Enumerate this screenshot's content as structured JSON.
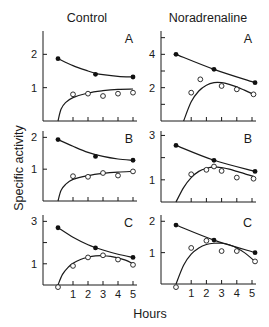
{
  "chart_data": {
    "type": "scatter",
    "title": "",
    "xlabel": "Hours",
    "ylabel": "Specific activity",
    "columns": [
      "Control",
      "Noradrenaline"
    ],
    "rows": [
      "A",
      "B",
      "C"
    ],
    "x_ticks": [
      1,
      2,
      3,
      4,
      5
    ],
    "legend": [
      {
        "marker": "filled-circle",
        "name": "series 1 (filled)"
      },
      {
        "marker": "open-circle",
        "name": "series 2 (open)"
      }
    ],
    "panels": [
      {
        "id": "control-A",
        "column": "Control",
        "row": "A",
        "letter": "A",
        "ylim": [
          0,
          2.7
        ],
        "y_ticks_major": [
          1,
          2
        ],
        "y_ticks_minor": [],
        "filled": {
          "x": [
            0,
            2.5,
            5
          ],
          "y": [
            1.87,
            1.4,
            1.32
          ]
        },
        "open": {
          "x": [
            1,
            2,
            3,
            4,
            5
          ],
          "y": [
            0.8,
            0.82,
            0.75,
            0.82,
            0.85
          ]
        },
        "filled_curve": {
          "x": [
            0,
            1,
            2,
            2.5,
            3,
            4,
            5
          ],
          "y": [
            1.87,
            1.66,
            1.5,
            1.43,
            1.39,
            1.34,
            1.32
          ]
        },
        "open_curve": {
          "x": [
            0,
            0.2,
            0.5,
            1,
            2,
            3,
            4,
            5
          ],
          "y": [
            0.0,
            0.35,
            0.55,
            0.7,
            0.84,
            0.91,
            0.95,
            0.96
          ]
        }
      },
      {
        "id": "noradrenaline-A",
        "column": "Noradrenaline",
        "row": "A",
        "letter": "A",
        "ylim": [
          0,
          5.4
        ],
        "y_ticks_major": [
          2,
          4
        ],
        "y_ticks_minor": [
          1,
          3,
          5
        ],
        "filled": {
          "x": [
            0,
            2.5,
            5.2
          ],
          "y": [
            4.0,
            3.1,
            2.3
          ]
        },
        "open": {
          "x": [
            1,
            1.6,
            3,
            4,
            5.1
          ],
          "y": [
            1.7,
            2.5,
            2.1,
            1.9,
            1.6
          ]
        },
        "filled_curve": {
          "x": [
            0,
            2.5,
            5.2
          ],
          "y": [
            4.0,
            3.1,
            2.3
          ]
        },
        "open_curve": {
          "x": [
            0.5,
            1,
            1.5,
            2,
            2.5,
            3,
            3.5,
            4,
            4.5,
            5.1
          ],
          "y": [
            0.0,
            1.15,
            1.8,
            2.15,
            2.3,
            2.3,
            2.2,
            2.05,
            1.85,
            1.6
          ]
        }
      },
      {
        "id": "control-B",
        "column": "Control",
        "row": "B",
        "letter": "B",
        "ylim": [
          0,
          2.2
        ],
        "y_ticks_major": [
          1,
          2
        ],
        "y_ticks_minor": [],
        "filled": {
          "x": [
            0,
            2.5,
            5
          ],
          "y": [
            1.93,
            1.4,
            1.28
          ]
        },
        "open": {
          "x": [
            1,
            2,
            3,
            4,
            5
          ],
          "y": [
            0.78,
            0.76,
            0.88,
            0.8,
            0.93
          ]
        },
        "filled_curve": {
          "x": [
            0,
            1,
            2,
            3,
            4,
            5
          ],
          "y": [
            1.93,
            1.72,
            1.53,
            1.4,
            1.32,
            1.28
          ]
        },
        "open_curve": {
          "x": [
            0,
            0.2,
            0.5,
            1,
            2,
            3,
            4,
            5
          ],
          "y": [
            0.0,
            0.33,
            0.52,
            0.68,
            0.8,
            0.87,
            0.91,
            0.93
          ]
        }
      },
      {
        "id": "noradrenaline-B",
        "column": "Noradrenaline",
        "row": "B",
        "letter": "B",
        "ylim": [
          0,
          3.2
        ],
        "y_ticks_major": [
          1,
          3
        ],
        "y_ticks_minor": [
          2
        ],
        "filled": {
          "x": [
            0,
            2.5,
            5.2
          ],
          "y": [
            2.55,
            1.88,
            1.38
          ]
        },
        "open": {
          "x": [
            1,
            2,
            2.5,
            3,
            4,
            5.1
          ],
          "y": [
            1.25,
            1.45,
            1.6,
            1.4,
            1.1,
            1.05
          ]
        },
        "filled_curve": {
          "x": [
            0,
            2.5,
            5.2
          ],
          "y": [
            2.55,
            1.88,
            1.38
          ]
        },
        "open_curve": {
          "x": [
            0,
            0.5,
            1,
            1.5,
            2,
            2.5,
            3,
            3.5,
            4,
            4.5,
            5.1
          ],
          "y": [
            0.0,
            0.65,
            1.1,
            1.38,
            1.52,
            1.58,
            1.55,
            1.48,
            1.38,
            1.28,
            1.15
          ]
        }
      },
      {
        "id": "control-C",
        "column": "Control",
        "row": "C",
        "letter": "C",
        "ylim": [
          0,
          3.3
        ],
        "y_ticks_major": [
          1,
          3
        ],
        "y_ticks_minor": [
          2
        ],
        "filled": {
          "x": [
            0,
            2.5,
            5
          ],
          "y": [
            2.7,
            1.75,
            1.3
          ]
        },
        "open": {
          "x": [
            0,
            1,
            2,
            3,
            4,
            5
          ],
          "y": [
            -0.1,
            0.9,
            1.3,
            1.4,
            1.2,
            0.95
          ]
        },
        "filled_curve": {
          "x": [
            0,
            1,
            2,
            3,
            4,
            5
          ],
          "y": [
            2.7,
            2.25,
            1.9,
            1.65,
            1.45,
            1.3
          ]
        },
        "open_curve": {
          "x": [
            0,
            0.3,
            0.7,
            1,
            1.5,
            2,
            2.5,
            3,
            3.5,
            4,
            4.5,
            5
          ],
          "y": [
            0.0,
            0.5,
            0.85,
            1.02,
            1.2,
            1.31,
            1.37,
            1.38,
            1.35,
            1.28,
            1.17,
            1.0
          ]
        }
      },
      {
        "id": "noradrenaline-C",
        "column": "Noradrenaline",
        "row": "C",
        "letter": "C",
        "ylim": [
          0,
          2.2
        ],
        "y_ticks_major": [
          1,
          2
        ],
        "y_ticks_minor": [],
        "filled": {
          "x": [
            0,
            2.5,
            5.2
          ],
          "y": [
            1.88,
            1.4,
            1.0
          ]
        },
        "open": {
          "x": [
            0,
            1,
            2,
            3,
            4,
            5.2
          ],
          "y": [
            -0.1,
            1.15,
            1.38,
            1.05,
            1.05,
            0.72
          ]
        },
        "filled_curve": {
          "x": [
            0,
            2.5,
            5.2
          ],
          "y": [
            1.88,
            1.4,
            1.0
          ]
        },
        "open_curve": {
          "x": [
            0,
            0.5,
            1,
            1.5,
            2,
            2.5,
            3,
            3.5,
            4,
            4.5,
            5.2
          ],
          "y": [
            0.0,
            0.6,
            0.95,
            1.15,
            1.26,
            1.3,
            1.3,
            1.25,
            1.15,
            1.0,
            0.72
          ]
        }
      }
    ]
  },
  "labels": {
    "col_control": "Control",
    "col_noradrenaline": "Noradrenaline",
    "ylabel": "Specific activity",
    "xlabel": "Hours"
  }
}
